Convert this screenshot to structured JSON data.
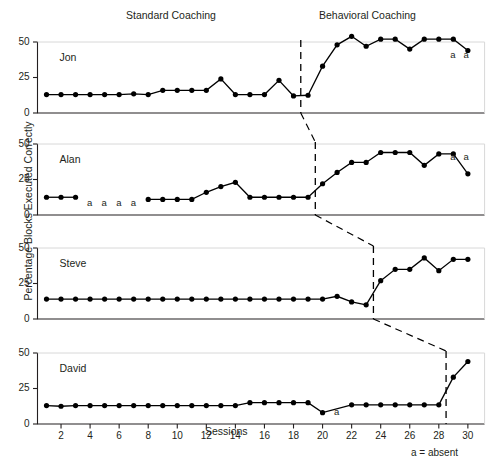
{
  "figure": {
    "phase_titles": {
      "standard": "Standard Coaching",
      "behavioral": "Behavioral Coaching"
    },
    "ylabel": "Percentage Blocks Executed Correctly",
    "xlabel": "Sessions",
    "footnote": "a = absent",
    "absent_symbol": "a",
    "line_color": "#000000",
    "marker_color": "#000000",
    "axis_color": "#231f20"
  },
  "chart_data": {
    "type": "line",
    "title": "",
    "xlabel": "Sessions",
    "ylabel": "Percentage Blocks Executed Correctly",
    "xlim": [
      0.3,
      31.2
    ],
    "ylim": [
      0,
      57
    ],
    "ytick_values": [
      0,
      25,
      50
    ],
    "ytick_labels": [
      "0",
      "25",
      "50"
    ],
    "xtick_values": [
      2,
      4,
      6,
      8,
      10,
      12,
      14,
      16,
      18,
      20,
      22,
      24,
      26,
      28,
      30
    ],
    "xtick_labels": [
      "2",
      "4",
      "6",
      "8",
      "10",
      "12",
      "14",
      "16",
      "18",
      "20",
      "22",
      "24",
      "26",
      "28",
      "30"
    ],
    "grid": false,
    "legend": "none",
    "annotations": [
      "a = absent"
    ],
    "phases": [
      {
        "name": "Standard Coaching",
        "label_x": 10
      },
      {
        "name": "Behavioral Coaching",
        "label_x": 25
      }
    ],
    "panels": [
      {
        "name": "Jon",
        "phase_line_session": 18.5,
        "series": [
          {
            "name": "Jon baseline",
            "phase": "Standard Coaching",
            "x": [
              1,
              2,
              3,
              4,
              5,
              6,
              7,
              8,
              9,
              10,
              11,
              12,
              13,
              14,
              15,
              16,
              17,
              18
            ],
            "y": [
              13,
              13,
              13,
              13,
              13,
              13,
              13.5,
              13,
              16,
              16,
              16,
              16,
              24,
              13,
              13,
              13,
              23,
              12
            ]
          },
          {
            "name": "Jon behavioral",
            "phase": "Behavioral Coaching",
            "x": [
              19,
              20,
              21,
              22,
              23,
              24,
              25,
              26,
              27,
              28,
              29,
              30
            ],
            "y": [
              12.5,
              33,
              48,
              54,
              47,
              52,
              52,
              45,
              52,
              52,
              52,
              44
            ]
          }
        ],
        "absences": [
          {
            "session": 29,
            "label": "a"
          },
          {
            "session": 29.9,
            "label": "a"
          }
        ]
      },
      {
        "name": "Alan",
        "phase_line_session": 19.5,
        "series": [
          {
            "name": "Alan baseline",
            "phase": "Standard Coaching",
            "x": [
              1,
              2,
              3
            ],
            "y": [
              12.5,
              12.5,
              12.5
            ]
          },
          {
            "name": "Alan baseline continued",
            "phase": "Standard Coaching",
            "x": [
              8,
              9,
              10,
              11,
              12,
              13,
              14,
              15,
              16,
              17,
              18,
              19
            ],
            "y": [
              11,
              11,
              11,
              11,
              16,
              20,
              23,
              12.5,
              12.5,
              12.5,
              12.5,
              12.5
            ]
          },
          {
            "name": "Alan behavioral",
            "phase": "Behavioral Coaching",
            "x": [
              20,
              21,
              22,
              23,
              24,
              25,
              26,
              27,
              28,
              29,
              30
            ],
            "y": [
              22,
              30,
              37,
              37,
              44,
              44,
              44,
              35,
              43,
              43,
              29
            ]
          }
        ],
        "absences": [
          {
            "session": 4,
            "label": "a"
          },
          {
            "session": 5,
            "label": "a"
          },
          {
            "session": 6,
            "label": "a"
          },
          {
            "session": 7,
            "label": "a"
          },
          {
            "session": 29,
            "label": "a"
          },
          {
            "session": 29.9,
            "label": "a"
          }
        ]
      },
      {
        "name": "Steve",
        "phase_line_session": 23.5,
        "series": [
          {
            "name": "Steve baseline",
            "phase": "Standard Coaching",
            "x": [
              1,
              2,
              3,
              4,
              5,
              6,
              7,
              8,
              9,
              10,
              11,
              12,
              13,
              14,
              15,
              16,
              17,
              18,
              19,
              20,
              21,
              22,
              23
            ],
            "y": [
              14,
              14,
              14,
              14,
              14,
              14,
              14,
              14,
              14,
              14,
              14,
              14,
              14,
              14,
              14,
              14,
              14,
              14,
              14,
              14,
              16,
              12,
              10
            ]
          },
          {
            "name": "Steve behavioral",
            "phase": "Behavioral Coaching",
            "x": [
              24,
              25,
              26,
              27,
              28,
              29,
              30
            ],
            "y": [
              27,
              35,
              35,
              43,
              34,
              42,
              42
            ]
          }
        ],
        "absences": []
      },
      {
        "name": "David",
        "phase_line_session": 28.5,
        "series": [
          {
            "name": "David baseline",
            "phase": "Standard Coaching",
            "x": [
              1,
              2,
              3,
              4,
              5,
              6,
              7,
              8,
              9,
              10,
              11,
              12,
              13,
              14,
              15,
              16,
              17,
              18,
              19,
              20,
              22,
              23,
              24,
              25,
              26,
              27,
              28
            ],
            "y": [
              13,
              12.5,
              13,
              13,
              13,
              13,
              13,
              13,
              13,
              13,
              13,
              13,
              13,
              13,
              15,
              15,
              15,
              15,
              15,
              8,
              13.5,
              13.5,
              13.5,
              13.5,
              13.5,
              13.5,
              13.5
            ]
          },
          {
            "name": "David behavioral",
            "phase": "Behavioral Coaching",
            "x": [
              29,
              30
            ],
            "y": [
              33,
              44
            ]
          }
        ],
        "absences": [
          {
            "session": 21,
            "label": "a"
          }
        ]
      }
    ]
  }
}
